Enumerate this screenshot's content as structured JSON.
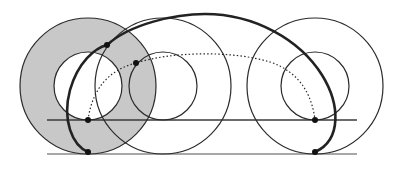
{
  "diagram": {
    "colors": {
      "stroke": "#2a2a2a",
      "shade": "#c8c8c8",
      "ground": "#a8a8a8",
      "background": "#ffffff"
    },
    "wheels": [
      {
        "name": "start",
        "cx": 88,
        "cy": 86,
        "outer_r": 68,
        "inner_r": 34,
        "shaded": true
      },
      {
        "name": "middle",
        "cx": 163,
        "cy": 86,
        "outer_r": 68,
        "inner_r": 34,
        "shaded": false
      },
      {
        "name": "end",
        "cx": 315,
        "cy": 86,
        "outer_r": 68,
        "inner_r": 34,
        "shaded": false
      }
    ],
    "lines": {
      "ground": {
        "x1": 47,
        "x2": 357,
        "y": 154
      },
      "inner_track": {
        "x1": 47,
        "x2": 357,
        "y": 120
      }
    },
    "points": [
      {
        "name": "inner-start",
        "x": 88,
        "y": 120
      },
      {
        "name": "outer-start",
        "x": 88,
        "y": 152
      },
      {
        "name": "inner-end",
        "x": 315,
        "y": 120
      },
      {
        "name": "outer-end",
        "x": 315,
        "y": 152
      },
      {
        "name": "outer-mid",
        "x": 107,
        "y": 45
      },
      {
        "name": "inner-mid",
        "x": 136,
        "y": 63
      }
    ]
  }
}
